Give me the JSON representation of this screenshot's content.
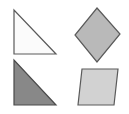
{
  "canvas": {
    "width": 129,
    "height": 114,
    "background": "#ffffff"
  },
  "shapes": [
    {
      "id": "white-right-triangle",
      "type": "right-triangle",
      "fill": "#fbfbfb",
      "stroke": "#5a5a5a",
      "points": "14,10 14,54 56,54"
    },
    {
      "id": "gray-diamond",
      "type": "rhombus",
      "fill": "#b9b9b9",
      "stroke": "#5a5a5a",
      "points": "97,8 120,34 97,62 75,35"
    },
    {
      "id": "dark-right-triangle",
      "type": "right-triangle",
      "fill": "#888888",
      "stroke": "#4a4a4a",
      "points": "14,60 14,105 56,105"
    },
    {
      "id": "light-parallelogram",
      "type": "parallelogram",
      "fill": "#d2d2d2",
      "stroke": "#5a5a5a",
      "points": "82,69 118,69 114,105 78,105"
    }
  ]
}
